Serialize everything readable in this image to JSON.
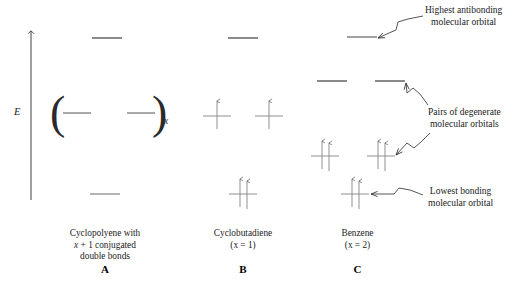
{
  "figure": {
    "axis": {
      "label": "E",
      "name": "energy-axis"
    },
    "columns": [
      {
        "id": "A",
        "letter": "A",
        "caption_line1": "Cyclopolyene with",
        "caption_line2_pre": "x",
        "caption_line2_post": " + 1 conjugated",
        "caption_line3": "double bonds",
        "paren_subscript": "x",
        "levels": [
          {
            "name": "antibonding-top",
            "y": 38,
            "electrons": 0
          },
          {
            "name": "degenerate-left",
            "y": 113,
            "electrons": 0
          },
          {
            "name": "degenerate-right",
            "y": 113,
            "electrons": 0
          },
          {
            "name": "bonding-bottom",
            "y": 194,
            "electrons": 0
          }
        ]
      },
      {
        "id": "B",
        "letter": "B",
        "caption_line1": "Cyclobutadiene",
        "caption_line2": "(x = 1)",
        "levels": [
          {
            "name": "antibonding-top",
            "y": 38,
            "electrons": 0
          },
          {
            "name": "degenerate-left",
            "y": 113,
            "electrons": 1
          },
          {
            "name": "degenerate-right",
            "y": 113,
            "electrons": 1
          },
          {
            "name": "bonding-bottom",
            "y": 194,
            "electrons": 2
          }
        ]
      },
      {
        "id": "C",
        "letter": "C",
        "caption_line1": "Benzene",
        "caption_line2": "(x = 2)",
        "levels": [
          {
            "name": "antibonding-top",
            "y": 37,
            "electrons": 0
          },
          {
            "name": "antibonding-degenerate-left",
            "y": 81,
            "electrons": 0
          },
          {
            "name": "antibonding-degenerate-right",
            "y": 81,
            "electrons": 0
          },
          {
            "name": "bonding-degenerate-left",
            "y": 153,
            "electrons": 2
          },
          {
            "name": "bonding-degenerate-right",
            "y": 153,
            "electrons": 2
          },
          {
            "name": "lowest-bonding",
            "y": 194,
            "electrons": 2
          }
        ]
      }
    ],
    "annotations": [
      {
        "id": "highest-antibonding",
        "line1": "Highest antibonding",
        "line2": "molecular orbital"
      },
      {
        "id": "pairs-degenerate",
        "line1": "Pairs of degenerate",
        "line2": "molecular orbitals"
      },
      {
        "id": "lowest-bonding",
        "line1": "Lowest bonding",
        "line2": "molecular orbital"
      }
    ]
  }
}
